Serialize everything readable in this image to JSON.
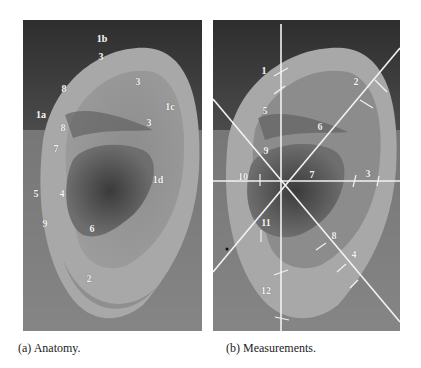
{
  "figure": {
    "panel_a": {
      "caption": "(a) Anatomy.",
      "labels": [
        {
          "text": "1b",
          "x": 102,
          "y": 39
        },
        {
          "text": "3",
          "x": 101,
          "y": 57
        },
        {
          "text": "3",
          "x": 138,
          "y": 82
        },
        {
          "text": "8",
          "x": 64,
          "y": 89
        },
        {
          "text": "1c",
          "x": 170,
          "y": 107
        },
        {
          "text": "1a",
          "x": 41,
          "y": 115
        },
        {
          "text": "3",
          "x": 149,
          "y": 123
        },
        {
          "text": "8",
          "x": 63,
          "y": 128
        },
        {
          "text": "7",
          "x": 56,
          "y": 149
        },
        {
          "text": "1d",
          "x": 158,
          "y": 180
        },
        {
          "text": "5",
          "x": 36,
          "y": 194
        },
        {
          "text": "4",
          "x": 62,
          "y": 194
        },
        {
          "text": "9",
          "x": 45,
          "y": 224
        },
        {
          "text": "6",
          "x": 92,
          "y": 229
        },
        {
          "text": "2",
          "x": 89,
          "y": 279
        }
      ]
    },
    "panel_b": {
      "caption": "(b) Measurements.",
      "labels": [
        {
          "text": "1",
          "x": 64,
          "y": 51
        },
        {
          "text": "2",
          "x": 156,
          "y": 62
        },
        {
          "text": "5",
          "x": 65,
          "y": 91
        },
        {
          "text": "6",
          "x": 120,
          "y": 107
        },
        {
          "text": "9",
          "x": 66,
          "y": 131
        },
        {
          "text": "10",
          "x": 43,
          "y": 157
        },
        {
          "text": "7",
          "x": 112,
          "y": 155
        },
        {
          "text": "3",
          "x": 158,
          "y": 154
        },
        {
          "text": "11",
          "x": 66,
          "y": 203
        },
        {
          "text": "8",
          "x": 114,
          "y": 216
        },
        {
          "text": "4",
          "x": 131,
          "y": 235
        },
        {
          "text": "12",
          "x": 66,
          "y": 271
        }
      ]
    }
  }
}
